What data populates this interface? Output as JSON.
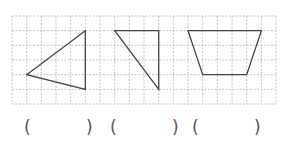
{
  "grid": {
    "left": 12,
    "top": 16,
    "cell": 14.67,
    "cols": 18,
    "rows": 6,
    "line_color": "#b5b5b5"
  },
  "shapes": [
    {
      "name": "triangle-1",
      "kind": "triangle",
      "points": [
        [
          1,
          4
        ],
        [
          5,
          1
        ],
        [
          5,
          5
        ]
      ]
    },
    {
      "name": "triangle-2",
      "kind": "right-triangle",
      "points": [
        [
          7,
          1
        ],
        [
          10,
          1
        ],
        [
          10,
          5
        ]
      ]
    },
    {
      "name": "trapezoid",
      "kind": "trapezoid",
      "points": [
        [
          12,
          1
        ],
        [
          17,
          1
        ],
        [
          16,
          4
        ],
        [
          13,
          4
        ]
      ]
    }
  ],
  "stroke_color": "#444444",
  "answers": [
    {
      "open": "(",
      "close": ")",
      "open_x": 24,
      "close_x": 86
    },
    {
      "open": "(",
      "close": ")",
      "open_x": 110,
      "close_x": 172
    },
    {
      "open": "(",
      "close": ")",
      "open_x": 192,
      "close_x": 254
    }
  ]
}
